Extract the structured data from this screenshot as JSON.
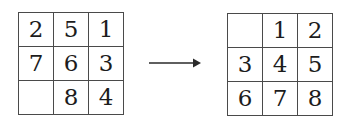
{
  "figure": {
    "type": "grid-transformation-diagram",
    "operator": {
      "icon": "long-rightwards-arrow-icon",
      "symbol": "⟶"
    },
    "left_grid": {
      "label": "source-grid",
      "rows": 3,
      "columns": 3,
      "cells": [
        [
          "2",
          "5",
          "1"
        ],
        [
          "7",
          "6",
          "3"
        ],
        [
          "",
          "8",
          "4"
        ]
      ]
    },
    "right_grid": {
      "label": "target-grid",
      "rows": 3,
      "columns": 3,
      "cells": [
        [
          "",
          "1",
          "2"
        ],
        [
          "3",
          "4",
          "5"
        ],
        [
          "6",
          "7",
          "8"
        ]
      ]
    },
    "colors": {
      "background": "#ffffff",
      "border": "#4a4a4a",
      "digit": "#1c1c1c",
      "arrow": "#2a2a2a"
    }
  }
}
